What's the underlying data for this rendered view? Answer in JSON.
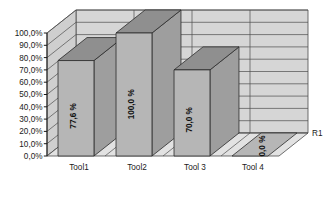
{
  "chart_data": {
    "type": "bar",
    "title": "",
    "subtitle": "",
    "xlabel": "",
    "ylabel": "",
    "categories": [
      "Tool1",
      "Tool2",
      "Tool 3",
      "Tool 4"
    ],
    "values": [
      77.6,
      100.0,
      70.0,
      0.0
    ],
    "data_labels": [
      "77,6 %",
      "100,0 %",
      "70,0 %",
      "0,0 %"
    ],
    "series": [
      {
        "name": "R1",
        "values": [
          77.6,
          100.0,
          70.0,
          0.0
        ]
      }
    ],
    "ylim": [
      0,
      100
    ],
    "ytick_values": [
      0,
      10,
      20,
      30,
      40,
      50,
      60,
      70,
      80,
      90,
      100
    ],
    "ytick_labels": [
      "0,0%",
      "10,0%",
      "20,0%",
      "30,0%",
      "40,0%",
      "50,0%",
      "60,0%",
      "70,0%",
      "80,0%",
      "90,0%",
      "100,0%"
    ],
    "grid": true,
    "three_d": true,
    "legend_position": "right",
    "legend_entries": [
      "R1"
    ],
    "colors": {
      "bar_front": "#b6b6b6",
      "bar_top": "#8f8f8f",
      "bar_side": "#9e9e9e",
      "bar_outline": "#2b2b2b",
      "wall_back": "#d6d6d6",
      "wall_left": "#cfcfcf",
      "floor": "#e2e2e2",
      "grid_line": "#4d4d4d",
      "text": "#1a1a1a",
      "background": "#ffffff"
    }
  }
}
